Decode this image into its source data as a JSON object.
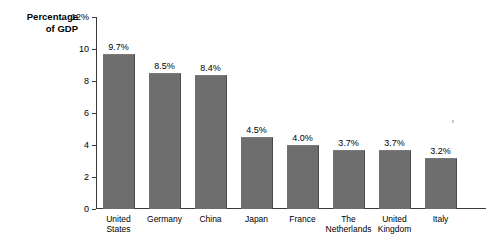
{
  "chart_data": {
    "type": "bar",
    "title": "",
    "xlabel": "",
    "ylabel": "Percentage\nof GDP",
    "ylim": [
      0,
      12
    ],
    "ytick_values": [
      12,
      10,
      8,
      6,
      4,
      2,
      0
    ],
    "ytick_labels": [
      "12%",
      "10",
      "8",
      "6",
      "4",
      "2",
      "0"
    ],
    "grid": false,
    "legend": "none",
    "bar_color": "#6e6e6e",
    "categories": [
      "United\nStates",
      "Germany",
      "China",
      "Japan",
      "France",
      "The\nNetherlands",
      "United\nKingdom",
      "Italy"
    ],
    "values": [
      9.7,
      8.5,
      8.4,
      4.5,
      4.0,
      3.7,
      3.7,
      3.2
    ],
    "value_labels": [
      "9.7%",
      "8.5%",
      "8.4%",
      "4.5%",
      "4.0%",
      "3.7%",
      "3.7%",
      "3.2%"
    ]
  }
}
